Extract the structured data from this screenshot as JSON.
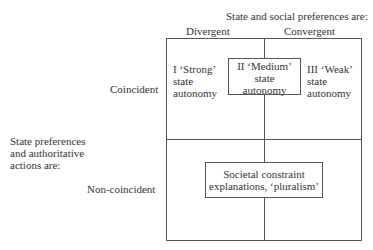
{
  "column_header": {
    "title": "State and social preferences are:",
    "columns": [
      "Divergent",
      "Convergent"
    ]
  },
  "row_header": {
    "title_lines": [
      "State preferences",
      "and authoritative",
      "actions are:"
    ],
    "rows": [
      "Coincident",
      "Non-coincident"
    ]
  },
  "cells": {
    "strong": [
      "I ‘Strong’",
      "state",
      "autonomy"
    ],
    "medium": [
      "II ‘Medium’",
      "state",
      "autonomy"
    ],
    "weak": [
      "III ‘Weak’",
      "state",
      "autonomy"
    ],
    "societal": [
      "Societal constraint",
      "explanations, ‘pluralism’"
    ]
  }
}
